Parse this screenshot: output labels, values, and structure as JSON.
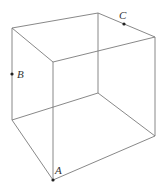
{
  "diagram": {
    "type": "cube-wireframe",
    "vertices": {
      "top_back_left": [
        12,
        28
      ],
      "top_back": [
        98,
        13
      ],
      "top_right": [
        155,
        37
      ],
      "top_front": [
        53,
        62
      ],
      "bottom_back_left": [
        12,
        120
      ],
      "bottom_back": [
        98,
        93
      ],
      "bottom_right": [
        155,
        136
      ],
      "bottom_front": [
        53,
        180
      ]
    },
    "points": [
      {
        "label": "A",
        "position": [
          53,
          180
        ],
        "label_position": [
          55,
          174
        ],
        "location": "bottom front vertex"
      },
      {
        "label": "B",
        "position": [
          12,
          74
        ],
        "label_position": [
          17,
          78
        ],
        "location": "midpoint of back-left vertical edge"
      },
      {
        "label": "C",
        "position": [
          124,
          24
        ],
        "label_position": [
          119,
          19
        ],
        "location": "on top back-right edge"
      }
    ],
    "edge_color": "#7a7a7a",
    "point_color": "#222222"
  }
}
